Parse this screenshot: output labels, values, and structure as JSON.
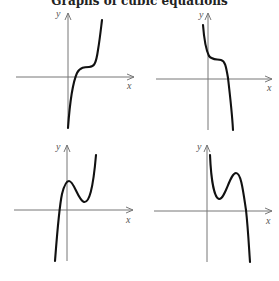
{
  "title": "Graphs of cubic equations",
  "panels": [
    {
      "id": "top-left",
      "x_label": "x",
      "y_label": "y",
      "description": "increasing cubic with a horizontal inflection plateau, one real root"
    },
    {
      "id": "top-right",
      "x_label": "x",
      "y_label": "y",
      "description": "decreasing cubic with a horizontal inflection plateau, one real root"
    },
    {
      "id": "bottom-left",
      "x_label": "x",
      "y_label": "y",
      "description": "positive leading coefficient cubic with local max and local min, one real root"
    },
    {
      "id": "bottom-right",
      "x_label": "x",
      "y_label": "y",
      "description": "negative leading coefficient cubic with local min and local max, one real root"
    }
  ],
  "colors": {
    "curve": "#111111",
    "axis": "#777777",
    "label": "#555555",
    "background": "#ffffff"
  }
}
